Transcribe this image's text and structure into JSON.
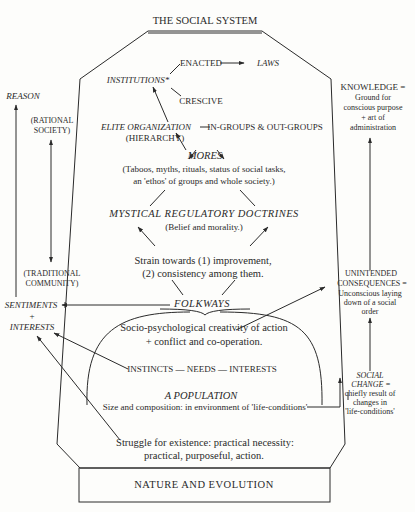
{
  "title": "THE SOCIAL SYSTEM",
  "base": "NATURE AND EVOLUTION",
  "nodes": {
    "enacted": "ENACTED",
    "laws": "LAWS",
    "institutions": "INSTITUTIONS*",
    "crescive": "CRESCIVE",
    "elite_organization": "ELITE ORGANIZATION",
    "hierarchy": "(HIERARCHY)",
    "in_groups": "IN-GROUPS & OUT-GROUPS",
    "mores": "MORES",
    "mores_desc_1": "(Taboos, myths, rituals, status of social tasks,",
    "mores_desc_2": "an 'ethos' of groups and whole society.)",
    "mystical": "MYSTICAL REGULATORY DOCTRINES",
    "mystical_desc": "(Belief and morality.)",
    "strain_1": "Strain towards (1) improvement,",
    "strain_2": "(2) consistency among them.",
    "folkways": "FOLKWAYS",
    "socio_1": "Socio-psychological creativity of action",
    "socio_2": "+ conflict and co-operation.",
    "instincts": "INSTINCTS — NEEDS — INTERESTS",
    "population": "A POPULATION",
    "population_desc": "Size and composition: in environment of 'life-conditions'",
    "struggle_1": "Struggle for existence: practical necessity:",
    "struggle_2": "practical, purposeful, action."
  },
  "left": {
    "reason": "REASON",
    "rational_1": "(RATIONAL",
    "rational_2": "SOCIETY)",
    "traditional_1": "(TRADITIONAL",
    "traditional_2": "COMMUNITY)",
    "sentiments": "SENTIMENTS",
    "plus": "+",
    "interests": "INTERESTS"
  },
  "right": {
    "knowledge_1": "KNOWLEDGE =",
    "knowledge_2": "Ground for",
    "knowledge_3": "conscious purpose",
    "knowledge_4": "+ art of",
    "knowledge_5": "administration",
    "unintended_1": "UNINTENDED",
    "unintended_2": "CONSEQUENCES =",
    "unintended_3": "Unconscious laying",
    "unintended_4": "down of a social",
    "unintended_5": "order",
    "social_change_1": "SOCIAL",
    "social_change_2": "CHANGE =",
    "social_change_3": "chiefly result of",
    "social_change_4": "changes in",
    "social_change_5": "'life-conditions'"
  },
  "colors": {
    "ink": "#2a2a2a",
    "paper": "#fdfdfb"
  }
}
